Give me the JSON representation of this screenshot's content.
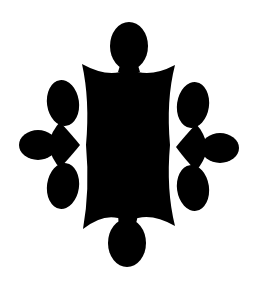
{
  "figure": {
    "description": "Black symmetrical ornamental cartouche with four-lobed clusters",
    "fill_color": "#000000",
    "background_color": "#ffffff",
    "parts": [
      "top-lobe",
      "central-body",
      "left-cluster",
      "right-cluster",
      "bottom-lobe"
    ]
  }
}
